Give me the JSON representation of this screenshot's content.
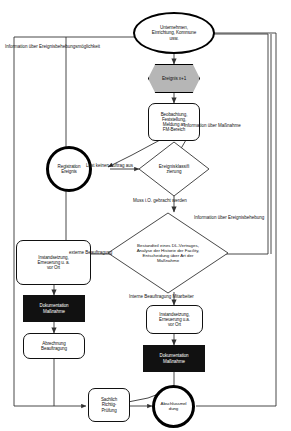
{
  "diagram": {
    "language": "de",
    "background_color": "#ffffff",
    "line_color": "#333333",
    "accent_gray": "#b6b6b6",
    "accent_black": "#111111"
  },
  "nodes": {
    "company": {
      "label": "Unternehmen,\nEinrichtung, Kommune\nusw.",
      "shape": "ellipse"
    },
    "event": {
      "label": "Ereignis x+1",
      "shape": "hexagon",
      "fill": "#b6b6b6"
    },
    "observation": {
      "label": "Beobachtung,\nFeststellung,\nMeldung an\nFM-Bereich",
      "shape": "rounded-rect"
    },
    "registration": {
      "label": "Registration\nEreignis",
      "shape": "circle-bold"
    },
    "classification": {
      "label": "Ereignisklassifi\nzierung",
      "shape": "diamond"
    },
    "decision_measure": {
      "label": "Bestandteil eines DL-Vertrages,\nAnalyse der Historie der Facility,\nEntscheidung über Art der\nMaßnahme",
      "shape": "diamond"
    },
    "repair_external": {
      "label": "Instandsetzung,\nErneuerung u. a.\nvor Ort",
      "shape": "rounded-rect"
    },
    "doc_external": {
      "label": "Dokumentation\nMaßnahme",
      "shape": "rect-filled",
      "fill": "#111111"
    },
    "billing": {
      "label": "Abrechnung\nBeauftragung",
      "shape": "rounded-rect"
    },
    "repair_internal": {
      "label": "Instandsetzung,\nErneuerung u.a.\nvor Ort",
      "shape": "rounded-rect"
    },
    "doc_internal": {
      "label": "Dokumentation\nMaßnahme",
      "shape": "rect-filled",
      "fill": "#111111"
    },
    "check": {
      "label": "Sachlich\nRichtig-\nPrüfung",
      "shape": "rounded-rect"
    },
    "final_report": {
      "label": "Abschlussmel\ndung",
      "shape": "circle-bold"
    }
  },
  "edge_labels": {
    "info_event_fix_possibility": "Information über Ereignisbehebungsmöglichkeit",
    "info_measure": "Information über Maßnahme",
    "no_order": "Löst keinen Auftrag aus",
    "must_be_fixed": "Muss i.O. gebracht werden",
    "info_event_fixed": "Information über Ereignisbehebung",
    "external_assignment": "externe Beauftragung",
    "internal_assignment": "Interne Beauftragung Mitarbeiter"
  }
}
